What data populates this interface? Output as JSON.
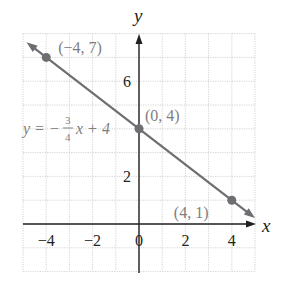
{
  "chart_data": {
    "type": "line",
    "title": "",
    "xlabel": "x",
    "ylabel": "y",
    "xlim": [
      -5,
      5
    ],
    "ylim": [
      -2,
      8
    ],
    "grid": true,
    "x_ticks": [
      {
        "value": -4,
        "label": "−4"
      },
      {
        "value": -2,
        "label": "−2"
      },
      {
        "value": 0,
        "label": "0"
      },
      {
        "value": 2,
        "label": "2"
      },
      {
        "value": 4,
        "label": "4"
      }
    ],
    "y_ticks": [
      {
        "value": 2,
        "label": "2"
      },
      {
        "value": 6,
        "label": "6"
      }
    ],
    "equation": {
      "lhs": "y = −",
      "numerator": "3",
      "denominator": "4",
      "rhs": "x + 4"
    },
    "series": [
      {
        "name": "y = -3/4 x + 4",
        "slope": -0.75,
        "intercept": 4,
        "color": "#6d6e71",
        "points": [
          {
            "x": -4,
            "y": 7,
            "label": "(−4, 7)"
          },
          {
            "x": 0,
            "y": 4,
            "label": "(0, 4)"
          },
          {
            "x": 4,
            "y": 1,
            "label": "(4, 1)"
          }
        ]
      }
    ]
  },
  "colors": {
    "axis": "#231f20",
    "grid": "#c8c8c8",
    "line": "#6d6e71",
    "label": "#808080"
  }
}
